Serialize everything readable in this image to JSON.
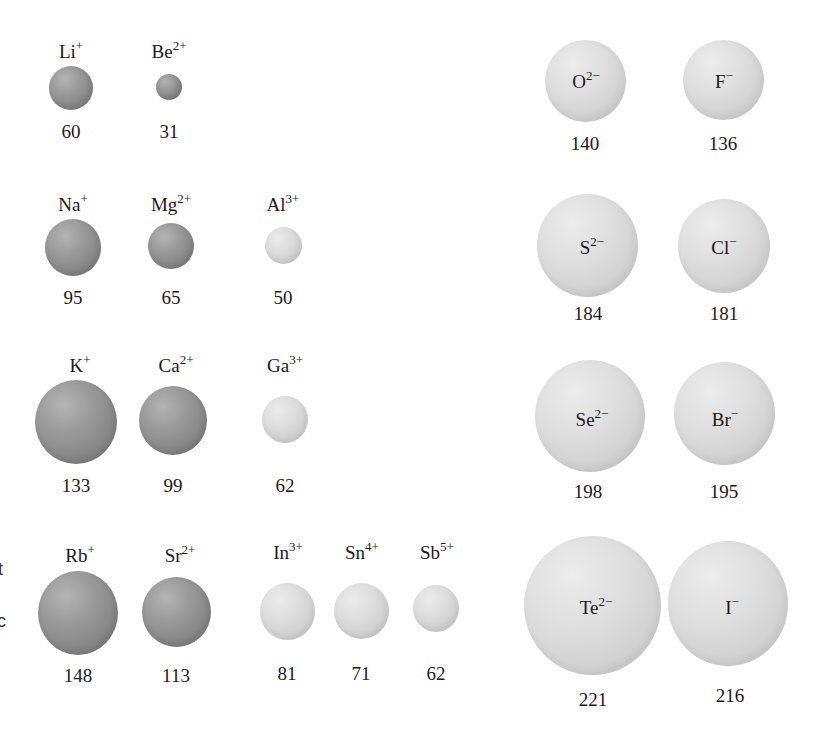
{
  "figure": {
    "unit": "pm",
    "cations": [
      {
        "element": "Li",
        "charge": "+",
        "radius": "60",
        "group": "1",
        "period": "2"
      },
      {
        "element": "Be",
        "charge": "2+",
        "radius": "31",
        "group": "2",
        "period": "2"
      },
      {
        "element": "Na",
        "charge": "+",
        "radius": "95",
        "group": "1",
        "period": "3"
      },
      {
        "element": "Mg",
        "charge": "2+",
        "radius": "65",
        "group": "2",
        "period": "3"
      },
      {
        "element": "Al",
        "charge": "3+",
        "radius": "50",
        "group": "13",
        "period": "3"
      },
      {
        "element": "K",
        "charge": "+",
        "radius": "133",
        "group": "1",
        "period": "4"
      },
      {
        "element": "Ca",
        "charge": "2+",
        "radius": "99",
        "group": "2",
        "period": "4"
      },
      {
        "element": "Ga",
        "charge": "3+",
        "radius": "62",
        "group": "13",
        "period": "4"
      },
      {
        "element": "Rb",
        "charge": "+",
        "radius": "148",
        "group": "1",
        "period": "5"
      },
      {
        "element": "Sr",
        "charge": "2+",
        "radius": "113",
        "group": "2",
        "period": "5"
      },
      {
        "element": "In",
        "charge": "3+",
        "radius": "81",
        "group": "13",
        "period": "5"
      },
      {
        "element": "Sn",
        "charge": "4+",
        "radius": "71",
        "group": "14",
        "period": "5"
      },
      {
        "element": "Sb",
        "charge": "5+",
        "radius": "62",
        "group": "15",
        "period": "5"
      }
    ],
    "anions": [
      {
        "element": "O",
        "charge": "2−",
        "radius": "140",
        "group": "16",
        "period": "2"
      },
      {
        "element": "F",
        "charge": "−",
        "radius": "136",
        "group": "17",
        "period": "2"
      },
      {
        "element": "S",
        "charge": "2−",
        "radius": "184",
        "group": "16",
        "period": "3"
      },
      {
        "element": "Cl",
        "charge": "−",
        "radius": "181",
        "group": "17",
        "period": "3"
      },
      {
        "element": "Se",
        "charge": "2−",
        "radius": "198",
        "group": "16",
        "period": "4"
      },
      {
        "element": "Br",
        "charge": "−",
        "radius": "195",
        "group": "17",
        "period": "4"
      },
      {
        "element": "Te",
        "charge": "2−",
        "radius": "221",
        "group": "16",
        "period": "5"
      },
      {
        "element": "I",
        "charge": "−",
        "radius": "216",
        "group": "17",
        "period": "5"
      }
    ],
    "cropped_edge_text": [
      "t",
      "c"
    ]
  }
}
